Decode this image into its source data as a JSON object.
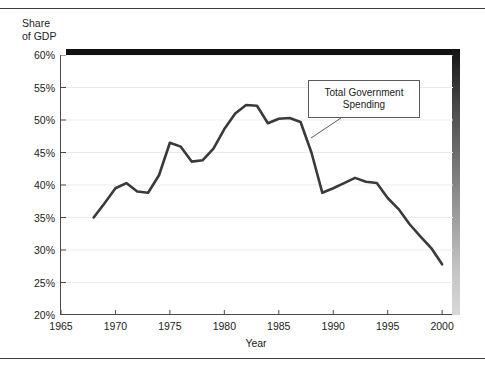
{
  "chart_data": {
    "type": "line",
    "title": "",
    "xlabel": "Year",
    "ylabel": "Share\nof GDP",
    "xlim": [
      1965,
      2001
    ],
    "ylim": [
      20,
      60
    ],
    "xticks": [
      1965,
      1970,
      1975,
      1980,
      1985,
      1990,
      1995,
      2000
    ],
    "xtick_labels": [
      "1965",
      "1970",
      "1975",
      "1980",
      "1985",
      "1990",
      "1995",
      "2000"
    ],
    "yticks": [
      20,
      25,
      30,
      35,
      40,
      45,
      50,
      55,
      60
    ],
    "ytick_labels": [
      "20%",
      "25%",
      "30%",
      "35%",
      "40%",
      "45%",
      "50%",
      "55%",
      "60%"
    ],
    "grid": "horizontal",
    "legend": "none",
    "series": [
      {
        "name": "Total Government Spending",
        "color": "#3a3a3a",
        "x": [
          1968,
          1969,
          1970,
          1971,
          1972,
          1973,
          1974,
          1975,
          1976,
          1977,
          1978,
          1979,
          1980,
          1981,
          1982,
          1983,
          1984,
          1985,
          1986,
          1987,
          1988,
          1989,
          1990,
          1991,
          1992,
          1993,
          1994,
          1995,
          1996,
          1997,
          1998,
          1999,
          2000
        ],
        "values": [
          35.0,
          37.2,
          39.5,
          40.3,
          39.0,
          38.8,
          41.5,
          46.5,
          45.9,
          43.6,
          43.8,
          45.6,
          48.6,
          51.0,
          52.3,
          52.2,
          49.5,
          50.2,
          50.3,
          49.7,
          45.0,
          38.8,
          39.5,
          40.3,
          41.1,
          40.5,
          40.3,
          38.0,
          36.3,
          34.0,
          32.1,
          30.3,
          27.8
        ]
      }
    ],
    "annotations": [
      {
        "name": "series-callout",
        "text_lines": [
          "Total Government",
          "Spending"
        ],
        "text": "Total Government Spending",
        "box": [
          308,
          80,
          112,
          38
        ],
        "leader_from": [
          340,
          118
        ],
        "leader_to": [
          310,
          138
        ]
      }
    ]
  },
  "figure": {
    "rule_color": "#3d3d3d",
    "frame_color": "#4a4a4a",
    "gridline_color": "#ebebeb",
    "line_color": "#3a3a3a",
    "background": "#ffffff"
  }
}
